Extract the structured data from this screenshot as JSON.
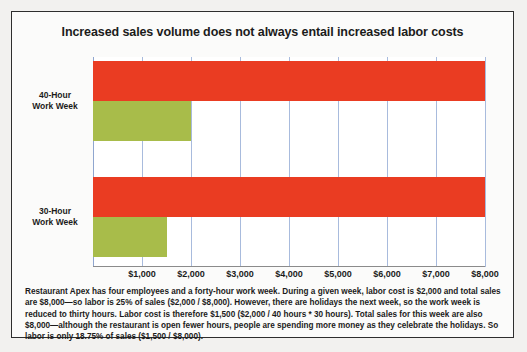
{
  "chart_data": {
    "type": "bar",
    "orientation": "horizontal",
    "title": "Increased sales volume does not always entail increased labor costs",
    "categories": [
      "40-Hour Work Week",
      "30-Hour Work Week"
    ],
    "series": [
      {
        "name": "Total Sales",
        "values": [
          8000,
          8000
        ],
        "color": "#ea3c22"
      },
      {
        "name": "Labor Cost",
        "values": [
          2000,
          1500
        ],
        "color": "#a8bc4a"
      }
    ],
    "xlabel": "",
    "ylabel": "",
    "xlim": [
      0,
      8000
    ],
    "x_ticks": [
      1000,
      2000,
      3000,
      4000,
      5000,
      6000,
      7000,
      8000
    ],
    "x_tick_labels": [
      "$1,000",
      "$2,000",
      "$3,000",
      "$4,000",
      "$5,000",
      "$6,000",
      "$7,000",
      "$8,000"
    ],
    "grid": true,
    "grid_color": "#a8bbdd",
    "legend": false
  },
  "caption": {
    "text": "Restaurant Apex has four employees and a forty-hour work week. During a given week, labor cost is $2,000 and total sales are $8,000—so labor is 25% of sales ($2,000 / $8,000). However, there are holidays the next week, so the work week is reduced to thirty hours. Labor cost is therefore $1,500 ($2,000 / 40 hours * 30 hours). Total sales for this week are also $8,000—although the restaurant is open fewer hours, people are spending more money as they celebrate the holidays. So labor is only 18.75% of sales ($1,500 / $8,000)."
  },
  "colors": {
    "sales_bar": "#ea3c22",
    "labor_bar": "#a8bc4a",
    "gridline": "#a8bbdd",
    "frame_border": "#2e2e2e",
    "page_background": "#f2f1ef",
    "plot_background": "#ffffff"
  }
}
